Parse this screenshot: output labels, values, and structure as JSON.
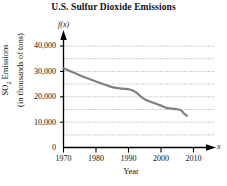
{
  "chart_data": {
    "type": "line",
    "title": "U.S. Sulfur Dioxide Emissions",
    "xlabel": "Year",
    "ylabel_line1": "SO2 Emissions",
    "ylabel_line2": "(in thousands of tons)",
    "function_label": "f(x)",
    "x_variable_label": "x",
    "xlim": [
      1970,
      2015
    ],
    "ylim": [
      0,
      42000
    ],
    "xticks": [
      1970,
      1980,
      1990,
      2000,
      2010
    ],
    "xtick_labels": [
      "1970",
      "1980",
      "1990",
      "2000",
      "2010"
    ],
    "yticks": [
      0,
      10000,
      20000,
      30000,
      40000
    ],
    "ytick_labels": [
      "0",
      "10,000",
      "20,000",
      "30,000",
      "40,000"
    ],
    "minor_gridline_step": 5000,
    "grid": "horizontal-dotted",
    "legend": "none",
    "line_color": "#808080",
    "axis_color": "#000000",
    "grid_color": "#999999",
    "series": [
      {
        "name": "SO2 emissions",
        "x": [
          1970,
          1975,
          1980,
          1985,
          1988,
          1990,
          1992,
          1995,
          2000,
          2002,
          2004,
          2006,
          2007,
          2008
        ],
        "values": [
          31200,
          28500,
          26000,
          23800,
          23200,
          23000,
          22000,
          19000,
          16500,
          15500,
          15200,
          14800,
          13500,
          12500
        ]
      }
    ]
  }
}
